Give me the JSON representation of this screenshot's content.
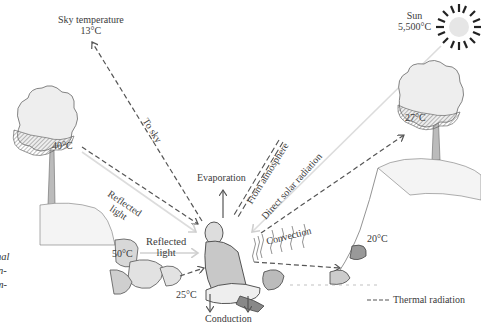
{
  "diagram": {
    "sources": {
      "sky": {
        "label": "Sky temperature",
        "temp": "13°C"
      },
      "sun": {
        "label": "Sun",
        "temp": "5,500°C"
      },
      "left_tree": {
        "temp": "40°C"
      },
      "right_tree": {
        "temp": "27°C"
      },
      "rock_left": {
        "temp": "50°C"
      },
      "ground": {
        "temp": "25°C"
      },
      "rock_right": {
        "temp": "20°C"
      }
    },
    "flows": {
      "to_sky": "To sky",
      "reflected_light_upper": [
        "Reflected",
        "light"
      ],
      "reflected_light_lower": [
        "Reflected",
        "light"
      ],
      "evaporation": "Evaporation",
      "from_atmosphere": "From atmosphere",
      "direct_solar": "Direct solar radiation",
      "convection": "Convection",
      "conduction": "Conduction"
    },
    "legend": {
      "thermal_radiation": "Thermal radiation"
    },
    "caption_fragments": [
      "nal",
      "n-",
      "m-"
    ],
    "colors": {
      "line": "#555555",
      "light_ray": "#d8d8d8",
      "ink": "#3a3a3a"
    }
  }
}
